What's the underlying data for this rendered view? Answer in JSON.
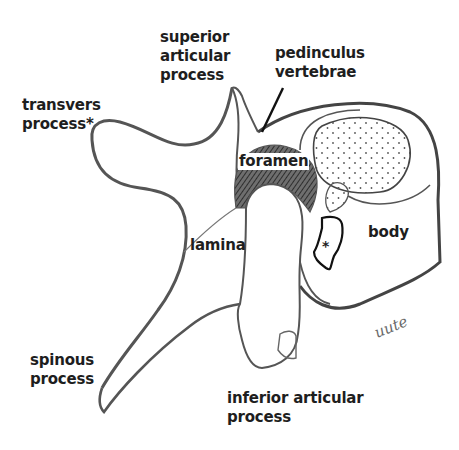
{
  "diagram": {
    "labels": {
      "superior_articular_process": "superior\narticular\nprocess",
      "pedinculus_vertebrae": "pedinculus\nvertebrae",
      "transvers_process": "transvers\nprocess*",
      "foramen": "foramen",
      "lamina": "lamina",
      "body": "body",
      "spinous_process": "spinous\nprocess",
      "inferior_articular_process": "inferior articular\nprocess",
      "asterisk_marker": "*"
    },
    "signature": "uute",
    "colors": {
      "outline": "#555555",
      "text": "#1e1e1e",
      "foramen_hatch": "#4a4a4a",
      "background": "#ffffff"
    }
  }
}
